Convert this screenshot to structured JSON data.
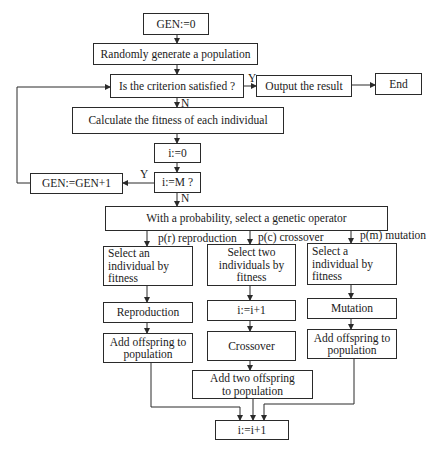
{
  "diagram": {
    "type": "flowchart",
    "nodes": {
      "gen_init": "GEN:=0",
      "random_pop": "Randomly generate a population",
      "criterion": "Is the criterion satisfied ?",
      "output": "Output the result",
      "end": "End",
      "fitness": "Calculate the fitness of each individual",
      "i_init": "i:=0",
      "i_check": "i:=M ?",
      "gen_inc": "GEN:=GEN+1",
      "select_op": "With a probability, select a genetic operator",
      "select_one_repro": "Select an individual by fitness",
      "select_two": "Select two individuals by fitness",
      "select_one_mut": "Select a individual by fitness",
      "reproduction": "Reproduction",
      "i_inc_mid": "i:=i+1",
      "mutation": "Mutation",
      "add_offspring_left": "Add offspring to population",
      "crossover": "Crossover",
      "add_offspring_right": "Add offspring to population",
      "add_two_offspring": "Add two offspring to population",
      "i_inc_bottom": "i:=i+1"
    },
    "edge_labels": {
      "criterion_yes": "Y",
      "criterion_no": "N",
      "i_check_yes": "Y",
      "i_check_no": "N",
      "branch_reproduction": "p(r) reproduction",
      "branch_crossover": "p(c) crossover",
      "branch_mutation": "p(m) mutation"
    },
    "edges": [
      [
        "gen_init",
        "random_pop"
      ],
      [
        "random_pop",
        "criterion"
      ],
      [
        "criterion",
        "output",
        "Y"
      ],
      [
        "output",
        "end"
      ],
      [
        "criterion",
        "fitness",
        "N"
      ],
      [
        "fitness",
        "i_init"
      ],
      [
        "i_init",
        "i_check"
      ],
      [
        "i_check",
        "gen_inc",
        "Y"
      ],
      [
        "gen_inc",
        "criterion"
      ],
      [
        "i_check",
        "select_op",
        "N"
      ],
      [
        "select_op",
        "select_one_repro",
        "p(r) reproduction"
      ],
      [
        "select_op",
        "select_two",
        "p(c) crossover"
      ],
      [
        "select_op",
        "select_one_mut",
        "p(m) mutation"
      ],
      [
        "select_one_repro",
        "reproduction"
      ],
      [
        "reproduction",
        "add_offspring_left"
      ],
      [
        "select_two",
        "i_inc_mid"
      ],
      [
        "i_inc_mid",
        "crossover"
      ],
      [
        "crossover",
        "add_two_offspring"
      ],
      [
        "select_one_mut",
        "mutation"
      ],
      [
        "mutation",
        "add_offspring_right"
      ],
      [
        "add_offspring_left",
        "i_inc_bottom"
      ],
      [
        "add_two_offspring",
        "i_inc_bottom"
      ],
      [
        "add_offspring_right",
        "i_inc_bottom"
      ]
    ],
    "colors": {
      "line": "#2a2a2a",
      "background": "#ffffff",
      "text": "#1a1a1a"
    }
  }
}
